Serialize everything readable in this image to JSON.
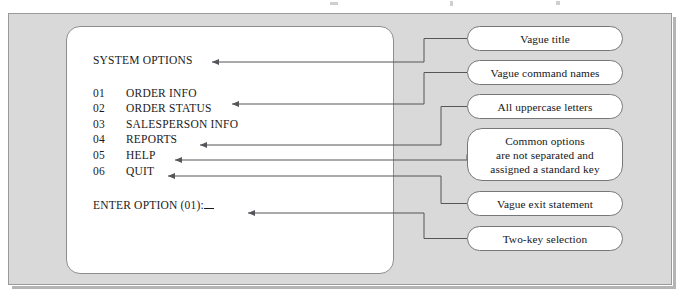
{
  "figure": {
    "kind": "annotated-ui-critique-diagram",
    "frame_color": "#d9d9d9",
    "screen_color": "#ffffff",
    "line_color": "#55555a"
  },
  "screen": {
    "title": "SYSTEM OPTIONS",
    "options": [
      {
        "code": "01",
        "label": "ORDER INFO"
      },
      {
        "code": "02",
        "label": "ORDER STATUS"
      },
      {
        "code": "03",
        "label": "SALESPERSON INFO"
      },
      {
        "code": "04",
        "label": "REPORTS"
      },
      {
        "code": "05",
        "label": "HELP"
      },
      {
        "code": "06",
        "label": "QUIT"
      }
    ],
    "prompt": "ENTER OPTION (01):",
    "input_value": ""
  },
  "callouts": [
    {
      "id": "vague-title",
      "text": "Vague title",
      "target": "title"
    },
    {
      "id": "vague-commands",
      "text": "Vague command names",
      "target": "option-02"
    },
    {
      "id": "all-uppercase",
      "text": "All uppercase letters",
      "target": "option-04"
    },
    {
      "id": "common-options",
      "line1": "Common options",
      "line2": "are not separated and",
      "line3": "assigned a standard key",
      "target": "option-05"
    },
    {
      "id": "vague-exit",
      "text": "Vague exit statement",
      "target": "option-06"
    },
    {
      "id": "two-key-selection",
      "text": "Two-key selection",
      "target": "prompt"
    }
  ]
}
